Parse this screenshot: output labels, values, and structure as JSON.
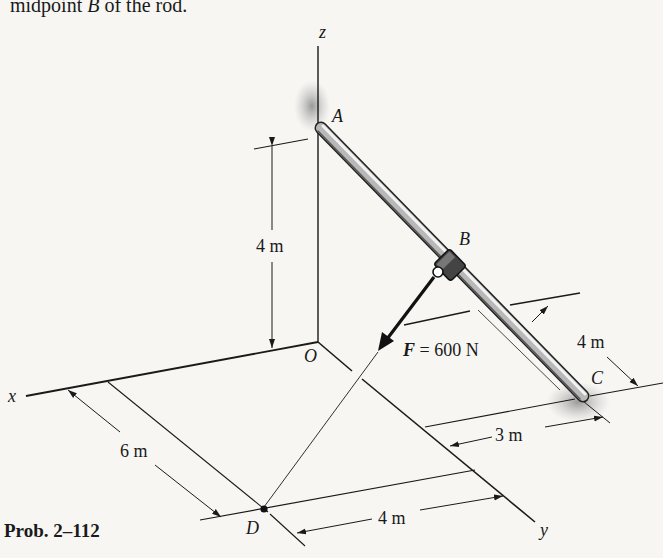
{
  "caption": {
    "prefix": "midpoint ",
    "point": "B",
    "suffix": " of the rod."
  },
  "problem_label": "Prob. 2–112",
  "axes": {
    "x": "x",
    "y": "y",
    "z": "z",
    "origin": "O"
  },
  "points": {
    "A": "A",
    "B": "B",
    "C": "C",
    "D": "D"
  },
  "force": {
    "symbol": "F",
    "equals": " = 600 N",
    "magnitude_N": 600
  },
  "dimensions": {
    "height_A": "4 m",
    "c_offset_x": "4 m",
    "c_offset_y": "3 m",
    "d_offset_x": "6 m",
    "d_offset_y": "4 m"
  },
  "colors": {
    "background": "#f7f6f3",
    "ink": "#1a1a1a",
    "rod": "#9a9a9a",
    "shadow": "#b5b5b5"
  }
}
